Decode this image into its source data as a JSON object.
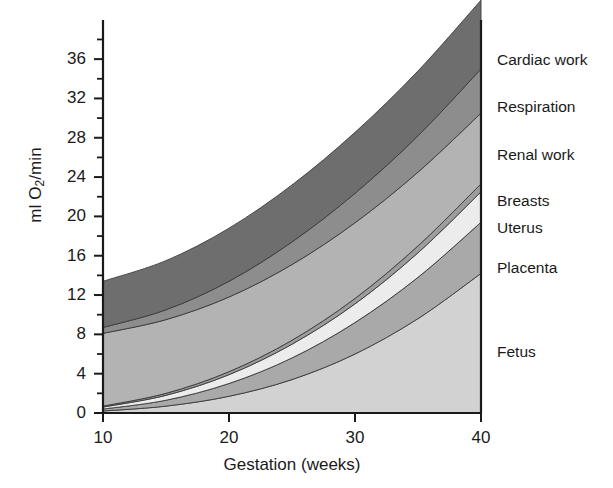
{
  "chart_data": {
    "type": "area",
    "title": "",
    "subtitle": "",
    "xlabel": "Gestation (weeks)",
    "ylabel": "ml O2/min",
    "ylabel_parts": {
      "pre": "ml O",
      "sub": "2",
      "post": "/min"
    },
    "xlim": [
      10,
      40
    ],
    "ylim": [
      0,
      38
    ],
    "grid": false,
    "legend_position": "right-outside-inline",
    "stacked": true,
    "xticks": [
      10,
      20,
      30,
      40
    ],
    "xtick_labels": [
      "10",
      "20",
      "30",
      "40"
    ],
    "x_minor_ticks": [],
    "yticks": [
      0,
      4,
      8,
      12,
      16,
      20,
      24,
      28,
      32,
      36
    ],
    "ytick_labels": [
      "0",
      "4",
      "8",
      "12",
      "16",
      "20",
      "24",
      "28",
      "32",
      "36"
    ],
    "y_minor_ticks": [
      2,
      6,
      10,
      14,
      18,
      22,
      26,
      30,
      34,
      38
    ],
    "x": [
      10,
      15,
      20,
      25,
      30,
      35,
      40
    ],
    "series": [
      {
        "name": "Fetus",
        "order_from_bottom": 1,
        "color": "#d2d2d2",
        "values": [
          0.2,
          0.7,
          1.7,
          3.4,
          6.0,
          9.6,
          14.2
        ]
      },
      {
        "name": "Placenta",
        "order_from_bottom": 2,
        "color": "#a9a9a9",
        "values": [
          0.2,
          0.6,
          1.3,
          2.2,
          3.2,
          4.2,
          5.2
        ]
      },
      {
        "name": "Uterus",
        "order_from_bottom": 3,
        "color": "#ececec",
        "values": [
          0.2,
          0.5,
          0.9,
          1.4,
          1.9,
          2.5,
          3.1
        ]
      },
      {
        "name": "Breasts",
        "order_from_bottom": 4,
        "color": "#9d9d9d",
        "values": [
          0.1,
          0.2,
          0.3,
          0.4,
          0.55,
          0.7,
          0.8
        ]
      },
      {
        "name": "Renal work",
        "order_from_bottom": 5,
        "color": "#b3b3b3",
        "values": [
          7.4,
          7.5,
          7.6,
          7.7,
          7.7,
          7.5,
          7.2
        ]
      },
      {
        "name": "Respiration",
        "order_from_bottom": 6,
        "color": "#8d8d8d",
        "values": [
          0.6,
          1.0,
          1.6,
          2.3,
          3.0,
          3.7,
          4.5
        ]
      },
      {
        "name": "Cardiac work",
        "order_from_bottom": 7,
        "color": "#6e6e6e",
        "values": [
          4.7,
          5.0,
          5.4,
          5.8,
          6.2,
          6.6,
          7.0
        ]
      }
    ],
    "totals": [
      13.4,
      15.5,
      18.8,
      23.2,
      28.55,
      34.8,
      42.0
    ],
    "legend_entries": [
      {
        "label": "Cardiac work",
        "y": 60
      },
      {
        "label": "Respiration",
        "y": 107
      },
      {
        "label": "Renal work",
        "y": 155
      },
      {
        "label": "Breasts",
        "y": 201
      },
      {
        "label": "Uterus",
        "y": 228
      },
      {
        "label": "Placenta",
        "y": 268
      },
      {
        "label": "Fetus",
        "y": 352
      }
    ],
    "colors": {
      "axis": "#1a1a1a",
      "background": "#ffffff",
      "text": "#1a1a1a"
    }
  }
}
